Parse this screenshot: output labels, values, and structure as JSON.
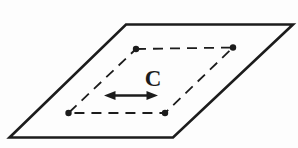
{
  "canvas": {
    "width": "298",
    "height": "148",
    "viewbox": "0 0 298 148",
    "background": "#fdfdfd",
    "ink": "#1c1c1c",
    "none": "none"
  },
  "plane": {
    "points": "126,24.5 293,24.5 173,137.5 9.5,137.5",
    "stroke_width": "2.6"
  },
  "loop": {
    "points": "136,49 233,47.5 165,113 68.5,113",
    "stroke_width": "1.8",
    "dash": "10 7"
  },
  "dot_radius": "3.2",
  "dots": [
    {
      "x": "136",
      "y": "49"
    },
    {
      "x": "233",
      "y": "47.5"
    },
    {
      "x": "165",
      "y": "113"
    },
    {
      "x": "68.5",
      "y": "113"
    }
  ],
  "label": {
    "text": "C",
    "x": "153",
    "y": "86",
    "font_size": "23"
  },
  "arrow": {
    "shaft": {
      "x1": "112",
      "y1": "95.5",
      "x2": "150",
      "y2": "95.5",
      "width": "2.7"
    },
    "left_head": "104,95.5 115.5,91 115.5,100",
    "right_head": "158,95.5 146.5,91 146.5,100"
  }
}
